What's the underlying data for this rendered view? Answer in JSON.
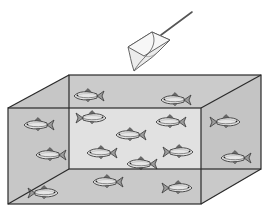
{
  "diagram": {
    "colors": {
      "background": "#ffffff",
      "tank_fill": "#c8c8c8",
      "tank_edge": "#2a2a2a",
      "fish_body": "#e6e6e6",
      "fish_outline": "#3a3a3a",
      "net_fill": "#f0f0f0",
      "net_outline": "#555555",
      "handle": "#555555"
    },
    "tank": {
      "front": {
        "x1": 8,
        "y1": 108,
        "x2": 201,
        "y2": 204
      },
      "back": {
        "x1": 69,
        "y1": 75,
        "x2": 261,
        "y2": 169
      }
    },
    "net": {
      "handle": {
        "x1": 192,
        "y1": 12,
        "x2": 161,
        "y2": 35
      },
      "rim": [
        [
          128,
          47
        ],
        [
          152,
          32
        ],
        [
          170,
          40
        ],
        [
          144,
          56
        ]
      ],
      "bag_tip": [
        134,
        71
      ]
    },
    "fish_count": 15,
    "fish": [
      {
        "x": 88,
        "y": 96,
        "dir": "left"
      },
      {
        "x": 175,
        "y": 100,
        "dir": "left"
      },
      {
        "x": 38,
        "y": 125,
        "dir": "left"
      },
      {
        "x": 92,
        "y": 118,
        "dir": "right"
      },
      {
        "x": 170,
        "y": 122,
        "dir": "left"
      },
      {
        "x": 226,
        "y": 122,
        "dir": "right"
      },
      {
        "x": 130,
        "y": 135,
        "dir": "left"
      },
      {
        "x": 101,
        "y": 153,
        "dir": "left"
      },
      {
        "x": 50,
        "y": 155,
        "dir": "left"
      },
      {
        "x": 179,
        "y": 152,
        "dir": "right"
      },
      {
        "x": 141,
        "y": 164,
        "dir": "left"
      },
      {
        "x": 235,
        "y": 158,
        "dir": "left"
      },
      {
        "x": 107,
        "y": 182,
        "dir": "left"
      },
      {
        "x": 44,
        "y": 193,
        "dir": "right"
      },
      {
        "x": 178,
        "y": 188,
        "dir": "right"
      }
    ]
  }
}
